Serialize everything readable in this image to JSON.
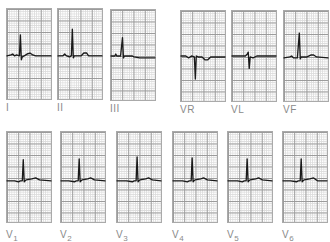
{
  "figure": {
    "rows": [
      {
        "leads": [
          {
            "id": "I",
            "label": "I",
            "sub": "",
            "waveform": "upright-small-t"
          },
          {
            "id": "II",
            "label": "II",
            "sub": "",
            "waveform": "upright-tall"
          },
          {
            "id": "III",
            "label": "III",
            "sub": "",
            "waveform": "upright-flat-t"
          },
          {
            "id": "VR",
            "label": "VR",
            "sub": "",
            "waveform": "inverted"
          },
          {
            "id": "VL",
            "label": "VL",
            "sub": "",
            "waveform": "biphasic"
          },
          {
            "id": "VF",
            "label": "VF",
            "sub": "",
            "waveform": "upright-tall"
          }
        ]
      },
      {
        "leads": [
          {
            "id": "V1",
            "label": "V",
            "sub": "1",
            "waveform": "upright"
          },
          {
            "id": "V2",
            "label": "V",
            "sub": "2",
            "waveform": "upright"
          },
          {
            "id": "V3",
            "label": "V",
            "sub": "3",
            "waveform": "upright"
          },
          {
            "id": "V4",
            "label": "V",
            "sub": "4",
            "waveform": "upright"
          },
          {
            "id": "V5",
            "label": "V",
            "sub": "5",
            "waveform": "upright"
          },
          {
            "id": "V6",
            "label": "V",
            "sub": "6",
            "waveform": "upright"
          }
        ]
      }
    ],
    "colors": {
      "trace": "#1a1a1a",
      "grid_major": "#9a9a9a",
      "grid_minor": "#dcdcdc",
      "label": "#8a8a8a"
    }
  }
}
